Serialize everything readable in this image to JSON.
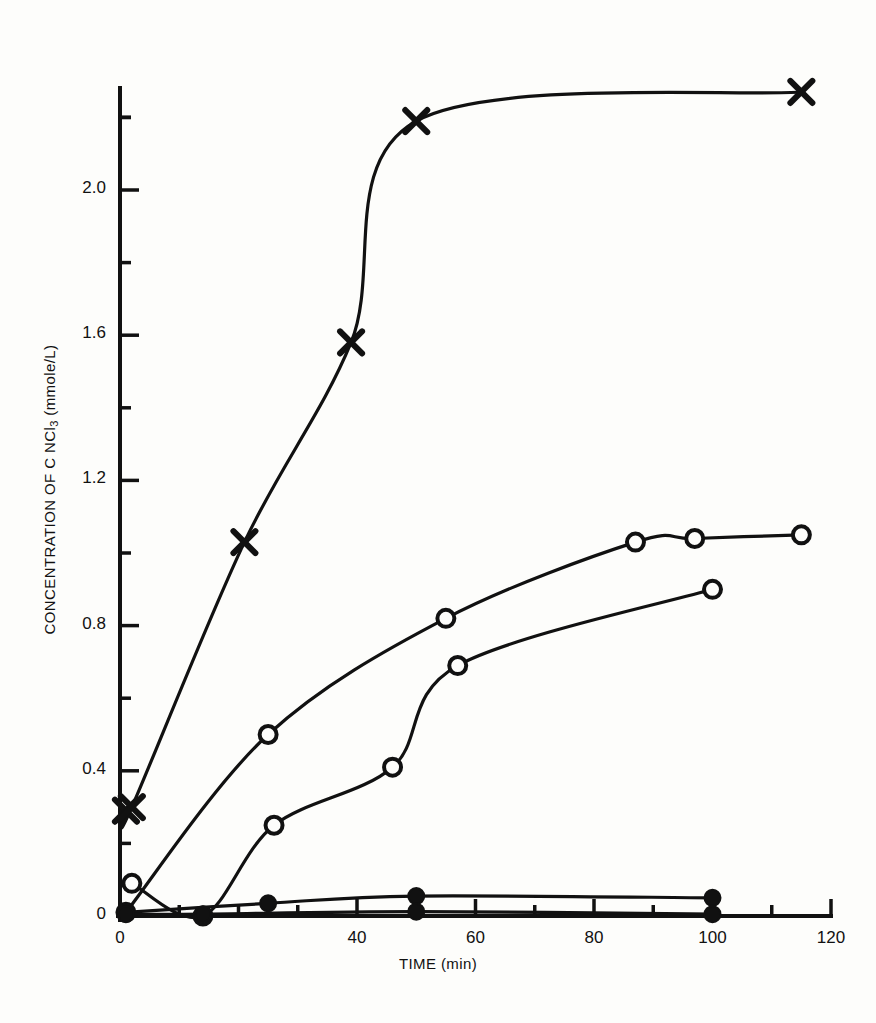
{
  "figure": {
    "background": "#fdfdfb",
    "ink": "#111111"
  },
  "axes": {
    "y_title_prefix": "CONCENTRATION OF C NCl",
    "y_title_sub": "3",
    "y_title_suffix": " (mmole/L)",
    "x_title": "TIME (min)",
    "y_ticks": [
      "0",
      "0.4",
      "0.8",
      "1.2",
      "1.6",
      "2.0"
    ],
    "x_ticks": [
      "0",
      "40",
      "60",
      "80",
      "100",
      "120"
    ]
  },
  "chart_data": {
    "type": "line",
    "title": "",
    "xlabel": "TIME (min)",
    "ylabel": "CONCENTRATION OF C NCl3 (mmole/L)",
    "xlim": [
      0,
      120
    ],
    "ylim": [
      0,
      2.35
    ],
    "xticks": [
      0,
      10,
      20,
      30,
      40,
      50,
      60,
      70,
      80,
      90,
      100,
      110,
      120
    ],
    "xticklabels": [
      "0",
      "",
      "",
      "",
      "40",
      "",
      "60",
      "",
      "80",
      "",
      "100",
      "",
      "120"
    ],
    "yticks": [
      0,
      0.2,
      0.4,
      0.6,
      0.8,
      1.0,
      1.2,
      1.4,
      1.6,
      1.8,
      2.0,
      2.2
    ],
    "yticklabels": [
      "0",
      "",
      "0.4",
      "",
      "0.8",
      "",
      "1.2",
      "",
      "1.6",
      "",
      "2.0",
      ""
    ],
    "grid": false,
    "legend": "none",
    "series": [
      {
        "name": "series-x-marker",
        "marker": "x",
        "x": [
          1,
          2,
          21,
          39,
          50,
          115
        ],
        "y": [
          0.29,
          0.3,
          1.03,
          1.58,
          2.19,
          2.27
        ]
      },
      {
        "name": "series-open-circle-upper",
        "marker": "open-circle",
        "x": [
          1,
          25,
          55,
          87,
          97,
          115
        ],
        "y": [
          0.01,
          0.5,
          0.82,
          1.03,
          1.04,
          1.05
        ]
      },
      {
        "name": "series-open-circle-lower",
        "marker": "open-circle",
        "x": [
          2,
          14,
          26,
          46,
          57,
          100
        ],
        "y": [
          0.09,
          0.0,
          0.25,
          0.41,
          0.69,
          0.9
        ]
      },
      {
        "name": "series-filled-circle-upper",
        "marker": "filled-circle",
        "x": [
          1,
          25,
          50,
          100
        ],
        "y": [
          0.01,
          0.035,
          0.055,
          0.05
        ]
      },
      {
        "name": "series-filled-circle-lower",
        "marker": "filled-circle",
        "x": [
          1,
          14,
          50,
          100
        ],
        "y": [
          0.005,
          0.005,
          0.012,
          0.005
        ]
      }
    ]
  }
}
